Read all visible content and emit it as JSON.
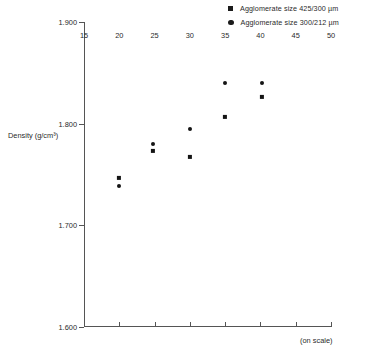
{
  "chart_data": {
    "type": "scatter",
    "title": "",
    "xlabel": "",
    "ylabel": "Density (g/cm³)",
    "x_note": "(on scale)",
    "xlim": [
      15,
      50
    ],
    "ylim": [
      1.6,
      1.9
    ],
    "xticks": [
      15,
      20,
      25,
      30,
      35,
      40,
      45,
      50
    ],
    "xtick_labels": [
      "15",
      "20",
      "25",
      "30",
      "35",
      "40",
      "45",
      "50"
    ],
    "yticks": [
      1.6,
      1.7,
      1.8,
      1.9
    ],
    "ytick_labels": [
      "1.600",
      "1.700",
      "1.800",
      "1.900"
    ],
    "grid": false,
    "legend_position": "top-right",
    "series": [
      {
        "name": "Agglomerate size 425/300 µm",
        "marker": "square",
        "color": "#141414",
        "points": [
          {
            "x": 20.0,
            "y": 1.747
          },
          {
            "x": 24.8,
            "y": 1.773
          },
          {
            "x": 30.0,
            "y": 1.767
          },
          {
            "x": 35.0,
            "y": 1.807
          },
          {
            "x": 40.2,
            "y": 1.826
          }
        ]
      },
      {
        "name": "Agglomerate size 300/212 µm",
        "marker": "circle",
        "color": "#141414",
        "points": [
          {
            "x": 20.0,
            "y": 1.739
          },
          {
            "x": 24.8,
            "y": 1.78
          },
          {
            "x": 30.0,
            "y": 1.795
          },
          {
            "x": 35.0,
            "y": 1.84
          },
          {
            "x": 40.2,
            "y": 1.84
          }
        ]
      }
    ]
  },
  "legend": {
    "items": [
      {
        "label": "Agglomerate size 425/300 µm",
        "marker": "square"
      },
      {
        "label": "Agglomerate size 300/212 µm",
        "marker": "circle"
      }
    ]
  },
  "axes": {
    "y_title": "Density (g/cm³)",
    "x_note": "(on scale)"
  }
}
